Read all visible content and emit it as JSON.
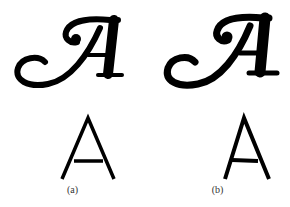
{
  "figure": {
    "panels": [
      {
        "label": "(a)",
        "glyph_script": "A",
        "glyph_sans": "A",
        "style": "smooth"
      },
      {
        "label": "(b)",
        "glyph_script": "A",
        "glyph_sans": "A",
        "style": "rough"
      }
    ]
  }
}
